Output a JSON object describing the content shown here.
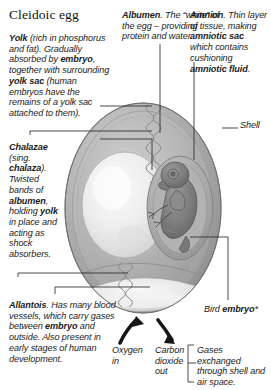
{
  "title": "Cleidoic egg",
  "diagram": {
    "colors": {
      "shell": "#a9a9a9",
      "albumen": "#b9b9b9",
      "yolk": "#ececec",
      "embryo": "#7e7e7e",
      "air_space": "#e8e8e8",
      "leader_line": "#2b2b2b",
      "text": "#1c1c1c",
      "background": "#ffffff"
    }
  },
  "labels": {
    "yolk": {
      "lead": "Yolk",
      "body": " (rich in phosphorus and fat). Gradually absorbed by ",
      "bold2": "embryo",
      "body2": ", together with surrounding ",
      "bold3": "yolk sac",
      "body3": " (human embryos have the remains of a yolk sac attached to them)."
    },
    "albumen": {
      "lead": "Albumen",
      "body": ". The “white” of the egg – providing protein and water."
    },
    "amnion": {
      "lead": "Amnion",
      "body": ". Thin layer of tissue, making ",
      "bold2": "amniotic sac",
      "body2": " which contains cushioning ",
      "bold3": "amniotic fluid",
      "body3": "."
    },
    "chalazae": {
      "lead": "Chalazae",
      "body": " (sing. ",
      "bold2": "chalaza",
      "body2": "). Twisted bands of ",
      "bold3": "albumen",
      "body3": ", holding ",
      "bold4": "yolk",
      "body4": " in place and acting as shock absorbers."
    },
    "allantois": {
      "lead": "Allantois",
      "body": ". Has many blood vessels, which carry gases between ",
      "bold2": "embryo",
      "body2": " and outside. Also present in early stages of human development."
    },
    "shell": "Shell",
    "bird_embryo": {
      "body": "Bird ",
      "bold": "embryo",
      "note": "*"
    },
    "oxygen_in": "Oxygen in",
    "carbon_dioxide_out": "Carbon dioxide out",
    "gases_exchanged": "Gases exchanged through shell and air space."
  }
}
